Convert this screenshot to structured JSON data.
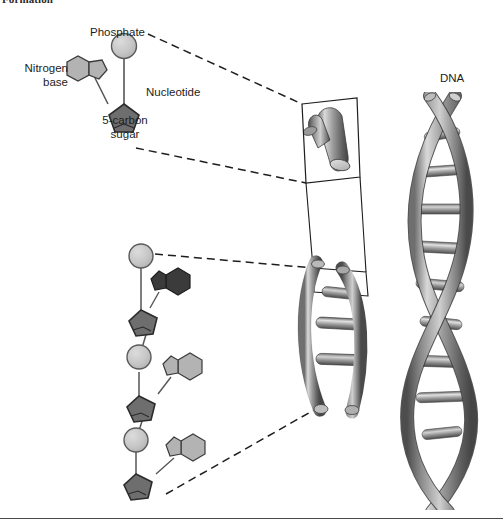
{
  "figure": {
    "clipped_heading": "Formation",
    "background_color": "#ffffff",
    "width": 503,
    "height": 531
  },
  "labels": {
    "phosphate": "Phosphate",
    "nitrogen_base_line1": "Nitrogen",
    "nitrogen_base_line2": "base",
    "sugar_line1": "5-carbon",
    "sugar_line2": "sugar",
    "nucleotide": "Nucleotide",
    "dna": "DNA"
  },
  "colors": {
    "phosphate_fill": "#c9c9c9",
    "phosphate_stroke": "#5a5a5a",
    "base_light_fill": "#b3b3b3",
    "base_dark_fill": "#3b3b3b",
    "sugar_fill": "#6e6e6e",
    "sugar_stroke": "#2b2b2b",
    "bond_stroke": "#555555",
    "dash_stroke": "#1e1e1e",
    "callout_stroke": "#1e1e1e",
    "helix_light": "#cfcfcf",
    "helix_mid": "#8d8d8d",
    "helix_dark": "#4a4a4a",
    "rung_light": "#d6d6d6",
    "rung_dark": "#5c5c5c",
    "rule_color": "#4a4a4a",
    "text_color": "#1d1d1d"
  },
  "diagram": {
    "type": "biology-illustration",
    "parts": [
      {
        "name": "nucleotide-detail",
        "description": "Single nucleotide: phosphate circle, 5-carbon sugar pentagon, nitrogen base double-ring",
        "components": [
          "phosphate",
          "5-carbon sugar",
          "nitrogen base"
        ]
      },
      {
        "name": "nucleotide-chain",
        "description": "Chain of three nucleotides with alternating phosphate circles, sugar pentagons and nitrogen bases",
        "nucleotide_count": 3,
        "base_shades": [
          "dark",
          "light",
          "light"
        ]
      },
      {
        "name": "magnified-inset",
        "description": "Enlarged cylindrical segment of the helix backbone with a cut end"
      },
      {
        "name": "helix-segment",
        "description": "Middle magnified portion of the double helix showing two backbones and cross rungs",
        "rung_count": 3
      },
      {
        "name": "dna-double-helix",
        "description": "Full DNA double helix with paired backbones and base-pair rungs",
        "rung_count": 9,
        "turns": 3
      }
    ],
    "connectors": [
      {
        "name": "phosphate-to-inset",
        "style": "dashed"
      },
      {
        "name": "sugar-to-inset",
        "style": "dashed"
      },
      {
        "name": "chain-top-to-helix",
        "style": "dashed"
      },
      {
        "name": "chain-bottom-to-helix",
        "style": "dashed"
      },
      {
        "name": "inset-to-helix-upper",
        "style": "solid"
      },
      {
        "name": "inset-to-helix-lower",
        "style": "solid"
      }
    ]
  }
}
